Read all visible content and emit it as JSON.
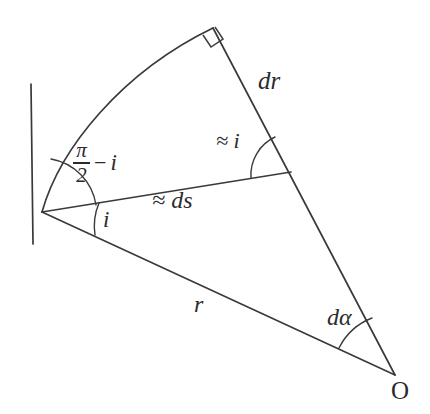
{
  "figure": {
    "background_color": "#ffffff",
    "stroke_color": "#3a3a3c",
    "text_color": "#2b2b2d",
    "width": 430,
    "height": 414
  },
  "points": {
    "P": {
      "name": "curve-point",
      "x": 42,
      "y": 212
    },
    "Q": {
      "name": "curve-far-point",
      "x": 213,
      "y": 28
    },
    "M": {
      "name": "ds-dr-junction",
      "x": 291,
      "y": 172
    },
    "O": {
      "name": "origin",
      "x": 395,
      "y": 375
    }
  },
  "labels": {
    "dr": "dr",
    "approx_i": "≈ i",
    "approx_ds": "≈ ds",
    "i": "i",
    "r": "r",
    "d_alpha": "dα",
    "origin": "O",
    "pi_half_minus_i": {
      "numerator": "π",
      "denominator": "2",
      "operator": "−",
      "variable": "i"
    }
  },
  "marks": {
    "right_angle": "right-angle-square",
    "angle_arcs": [
      "pi-half-minus-i-arc",
      "i-arc",
      "approx-i-arc",
      "d-alpha-arc"
    ]
  },
  "segments": [
    {
      "name": "tangent-line",
      "from": "above-P",
      "to": "below-P"
    },
    {
      "name": "curve-arc",
      "from": "P",
      "to": "Q"
    },
    {
      "name": "dr-segment",
      "from": "Q",
      "to": "O",
      "label": "dr"
    },
    {
      "name": "ds-segment",
      "from": "P",
      "to": "M",
      "label": "≈ ds"
    },
    {
      "name": "r-segment",
      "from": "P",
      "to": "O",
      "label": "r"
    }
  ]
}
